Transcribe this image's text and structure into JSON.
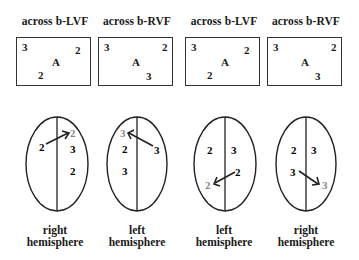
{
  "panels": [
    {
      "title": "across  b-LVF",
      "box": {
        "top_left": "3",
        "top_right": "2",
        "center": "A",
        "bottom": "2"
      },
      "caption": {
        "line1": "right",
        "line2": "hemisphere"
      }
    },
    {
      "title": "across  b-RVF",
      "box": {
        "top_left": "3",
        "top_right": "2",
        "center": "A",
        "bottom": "3"
      },
      "caption": {
        "line1": "left",
        "line2": "hemisphere"
      }
    },
    {
      "title": "across  b-LVF",
      "box": {
        "top_left": "3",
        "top_right": "2",
        "center": "A",
        "bottom": "2"
      },
      "caption": {
        "line1": "left",
        "line2": "hemisphere"
      }
    },
    {
      "title": "across  b-RVF",
      "box": {
        "top_left": "3",
        "top_right": "2",
        "center": "A",
        "bottom": "3"
      },
      "caption": {
        "line1": "right",
        "line2": "hemisphere"
      }
    }
  ],
  "brains": [
    {
      "labels": {
        "a": "2",
        "b": "3",
        "c": "2",
        "arrow_from": "2",
        "arrow_to": "2"
      }
    },
    {
      "labels": {
        "a": "2",
        "b": "3",
        "c": "3",
        "arrow_from": "3",
        "arrow_to": "3"
      }
    },
    {
      "labels": {
        "a": "2",
        "b": "3",
        "c": "2",
        "arrow_from": "2",
        "arrow_to": "2"
      }
    },
    {
      "labels": {
        "a": "2",
        "b": "3",
        "c": "3",
        "arrow_from": "3",
        "arrow_to": "3"
      }
    }
  ]
}
